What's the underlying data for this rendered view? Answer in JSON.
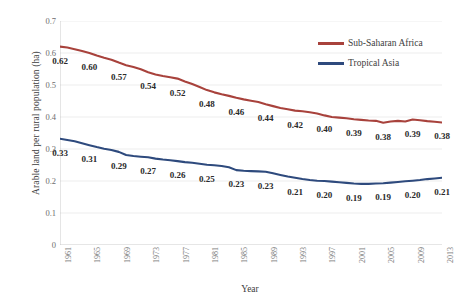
{
  "chart_data": {
    "type": "line",
    "title": "",
    "xlabel": "Year",
    "ylabel": "Arable land per rural population (ha)",
    "ylim": [
      0,
      0.7
    ],
    "xlim": [
      1961,
      2013
    ],
    "grid": true,
    "legend_position": "top-right",
    "y_ticks": [
      "0",
      "0.1",
      "0.2",
      "0.3",
      "0.4",
      "0.5",
      "0.6",
      "0.7"
    ],
    "y_tick_values": [
      0,
      0.1,
      0.2,
      0.3,
      0.4,
      0.5,
      0.6,
      0.7
    ],
    "x_tick_labels": [
      "1961",
      "1965",
      "1969",
      "1973",
      "1977",
      "1981",
      "1985",
      "1989",
      "1993",
      "1997",
      "2001",
      "2005",
      "2009",
      "2013"
    ],
    "x_tick_values": [
      1961,
      1965,
      1969,
      1973,
      1977,
      1981,
      1985,
      1989,
      1993,
      1997,
      2001,
      2005,
      2009,
      2013
    ],
    "x": [
      1961,
      1962,
      1963,
      1964,
      1965,
      1966,
      1967,
      1968,
      1969,
      1970,
      1971,
      1972,
      1973,
      1974,
      1975,
      1976,
      1977,
      1978,
      1979,
      1980,
      1981,
      1982,
      1983,
      1984,
      1985,
      1986,
      1987,
      1988,
      1989,
      1990,
      1991,
      1992,
      1993,
      1994,
      1995,
      1996,
      1997,
      1998,
      1999,
      2000,
      2001,
      2002,
      2003,
      2004,
      2005,
      2006,
      2007,
      2008,
      2009,
      2010,
      2011,
      2012,
      2013
    ],
    "series": [
      {
        "name": "Sub-Saharan Africa",
        "color": "#A8423C",
        "values": [
          0.62,
          0.617,
          0.612,
          0.606,
          0.6,
          0.592,
          0.585,
          0.579,
          0.57,
          0.562,
          0.556,
          0.549,
          0.54,
          0.533,
          0.528,
          0.524,
          0.52,
          0.511,
          0.503,
          0.494,
          0.484,
          0.477,
          0.471,
          0.466,
          0.46,
          0.455,
          0.451,
          0.447,
          0.44,
          0.434,
          0.428,
          0.424,
          0.42,
          0.418,
          0.415,
          0.411,
          0.405,
          0.4,
          0.398,
          0.396,
          0.393,
          0.391,
          0.389,
          0.388,
          0.382,
          0.386,
          0.388,
          0.386,
          0.392,
          0.39,
          0.387,
          0.385,
          0.383
        ],
        "labeled_points": [
          {
            "x": 1961,
            "label": "0.62"
          },
          {
            "x": 1965,
            "label": "0.60"
          },
          {
            "x": 1969,
            "label": "0.57"
          },
          {
            "x": 1973,
            "label": "0.54"
          },
          {
            "x": 1977,
            "label": "0.52"
          },
          {
            "x": 1981,
            "label": "0.48"
          },
          {
            "x": 1985,
            "label": "0.46"
          },
          {
            "x": 1989,
            "label": "0.44"
          },
          {
            "x": 1993,
            "label": "0.42"
          },
          {
            "x": 1997,
            "label": "0.40"
          },
          {
            "x": 2001,
            "label": "0.39"
          },
          {
            "x": 2005,
            "label": "0.38"
          },
          {
            "x": 2009,
            "label": "0.39"
          },
          {
            "x": 2013,
            "label": "0.38"
          }
        ]
      },
      {
        "name": "Tropical Asia",
        "color": "#2E4A7D",
        "values": [
          0.332,
          0.328,
          0.324,
          0.318,
          0.312,
          0.306,
          0.301,
          0.297,
          0.291,
          0.281,
          0.278,
          0.276,
          0.274,
          0.27,
          0.267,
          0.265,
          0.262,
          0.259,
          0.257,
          0.254,
          0.251,
          0.249,
          0.247,
          0.243,
          0.234,
          0.232,
          0.231,
          0.23,
          0.229,
          0.224,
          0.219,
          0.214,
          0.21,
          0.206,
          0.203,
          0.201,
          0.2,
          0.198,
          0.196,
          0.194,
          0.192,
          0.191,
          0.191,
          0.192,
          0.193,
          0.195,
          0.197,
          0.199,
          0.201,
          0.203,
          0.206,
          0.208,
          0.21
        ],
        "labeled_points": [
          {
            "x": 1961,
            "label": "0.33"
          },
          {
            "x": 1965,
            "label": "0.31"
          },
          {
            "x": 1969,
            "label": "0.29"
          },
          {
            "x": 1973,
            "label": "0.27"
          },
          {
            "x": 1977,
            "label": "0.26"
          },
          {
            "x": 1981,
            "label": "0.25"
          },
          {
            "x": 1985,
            "label": "0.23"
          },
          {
            "x": 1989,
            "label": "0.23"
          },
          {
            "x": 1993,
            "label": "0.21"
          },
          {
            "x": 1997,
            "label": "0.20"
          },
          {
            "x": 2001,
            "label": "0.19"
          },
          {
            "x": 2005,
            "label": "0.19"
          },
          {
            "x": 2009,
            "label": "0.20"
          },
          {
            "x": 2013,
            "label": "0.21"
          }
        ]
      }
    ]
  },
  "legend": {
    "items": [
      {
        "label": "Sub-Saharan Africa",
        "color": "#A8423C"
      },
      {
        "label": "Tropical Asia",
        "color": "#2E4A7D"
      }
    ]
  },
  "colors": {
    "sub_saharan_africa": "#A8423C",
    "tropical_asia": "#2E4A7D",
    "gridline": "#E8E8E8",
    "axis": "#BFBFBF",
    "tick_text": "#6d6d6d",
    "label_text": "#2a2a2a"
  }
}
